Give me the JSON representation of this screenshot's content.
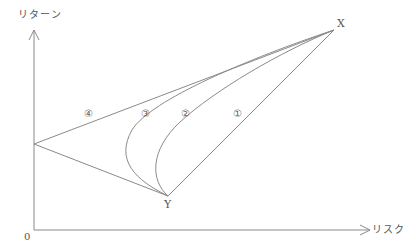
{
  "diagram": {
    "y_axis_label": "リターン",
    "x_axis_label": "リスク",
    "origin_label": "0",
    "points": {
      "X": {
        "label": "X",
        "x": 334,
        "y": 30
      },
      "Y": {
        "label": "Y",
        "x": 168,
        "y": 196
      },
      "intercept": {
        "x": 34,
        "y": 144
      }
    },
    "curves": [
      {
        "id": "1",
        "label": "①",
        "kind": "straight line Y to X"
      },
      {
        "id": "2",
        "label": "②",
        "kind": "curve Y to X"
      },
      {
        "id": "3",
        "label": "③",
        "kind": "curve Y to X (more bent)"
      },
      {
        "id": "4",
        "label": "④",
        "kind": "two line segments Y to intercept to X"
      }
    ],
    "stroke_color": "#888888"
  }
}
